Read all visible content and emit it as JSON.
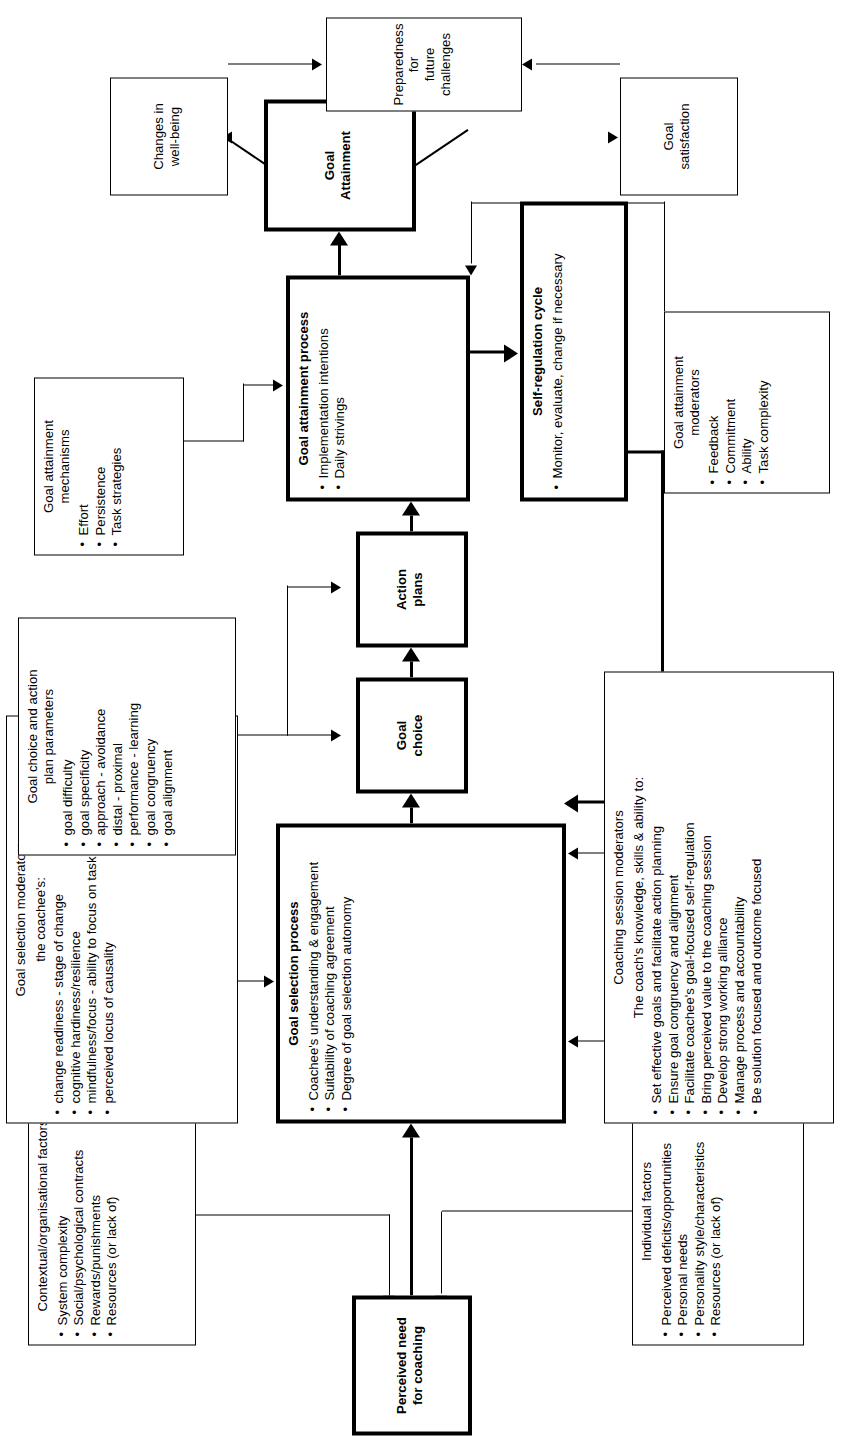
{
  "diagram": {
    "nodes": {
      "perceived_need": {
        "label": "Perceived need\nfor coaching"
      },
      "contextual_factors": {
        "title": "Contextual/organisational factors",
        "bullets": [
          "System complexity",
          "Social/psychological contracts",
          "Rewards/punishments",
          "Resources (or lack of)"
        ]
      },
      "individual_factors": {
        "title": "Individual factors",
        "bullets": [
          "Perceived deficits/opportunities",
          "Personal needs",
          "Personality style/characteristics",
          "Resources (or lack of)"
        ]
      },
      "goal_selection_process": {
        "title": "Goal selection process",
        "bullets": [
          "Coachee's understanding & engagement",
          "Suitability of coaching agreement",
          "Degree of goal selection autonomy"
        ]
      },
      "goal_selection_moderators": {
        "title": "Goal selection moderators",
        "subtitle": "the coachee's:",
        "bullets": [
          "change readiness - stage of change",
          "cognitive hardiness/resilience",
          "mindfulness/focus - ability to focus on task",
          "perceived locus of causality"
        ]
      },
      "coaching_session_moderators": {
        "title": "Coaching session moderators",
        "subtitle": "The coach's knowledge, skills & ability to:",
        "bullets": [
          "Set effective goals and facilitate action planning",
          "Ensure goal congruency and alignment",
          "Facilitate coachee's goal-focused self-regulation",
          "Bring perceived value to the coaching session",
          "Develop strong working alliance",
          "Manage process and accountability",
          "Be solution focused and outcome focused"
        ]
      },
      "goal_choice": {
        "label": "Goal\nchoice"
      },
      "action_plans": {
        "label": "Action\nplans"
      },
      "goal_choice_parameters": {
        "title": "Goal choice and action\nplan parameters",
        "bullets": [
          "goal difficulty",
          "goal specificity",
          "approach - avoidance",
          "distal - proximal",
          "performance - learning",
          "goal congruency",
          "goal alignment"
        ]
      },
      "goal_attainment_process": {
        "title": "Goal attainment process",
        "bullets": [
          "Implementation intentions",
          "Daily strivings"
        ]
      },
      "self_regulation_cycle": {
        "title": "Self-regulation cycle",
        "bullets": [
          "Monitor, evaluate, change if necessary"
        ]
      },
      "goal_attainment_mechanisms": {
        "title": "Goal attainment\nmechanisms",
        "bullets": [
          "Effort",
          "Persistence",
          "Task strategies"
        ]
      },
      "goal_attainment_moderators": {
        "title": "Goal attainment\nmoderators",
        "bullets": [
          "Feedback",
          "Commitment",
          "Ability",
          "Task complexity"
        ]
      },
      "goal_attainment": {
        "label": "Goal\nAttainment"
      },
      "changes_wellbeing": {
        "label": "Changes in\nwell-being"
      },
      "goal_satisfaction": {
        "label": "Goal\nsatisfaction"
      },
      "preparedness": {
        "label": "Preparedness for\nfuture challenges"
      }
    },
    "colors": {
      "stroke": "#000000",
      "background": "#ffffff"
    }
  }
}
